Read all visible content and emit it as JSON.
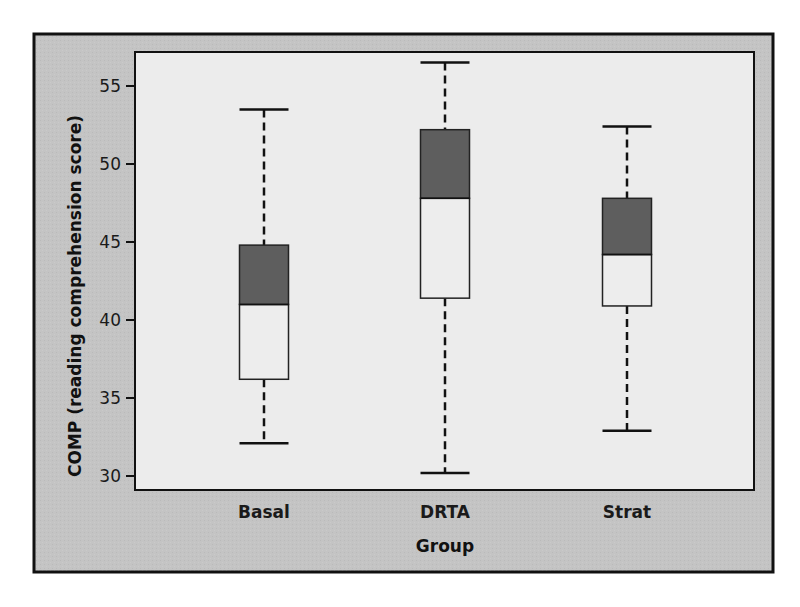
{
  "chart_data": {
    "type": "box",
    "title": "",
    "xlabel": "Group",
    "ylabel": "COMP (reading comprehension score)",
    "ylim": [
      29.3,
      57.5
    ],
    "yticks": [
      30,
      35,
      40,
      45,
      50,
      55
    ],
    "ytick_labels": [
      "30",
      "35",
      "40",
      "45",
      "50",
      "55"
    ],
    "categories": [
      "Basal",
      "DRTA",
      "Strat"
    ],
    "series": [
      {
        "name": "Basal",
        "min": 32.1,
        "q1": 36.2,
        "median": 41.0,
        "q3": 44.8,
        "max": 53.5
      },
      {
        "name": "DRTA",
        "min": 30.2,
        "q1": 41.4,
        "median": 47.8,
        "q3": 52.2,
        "max": 56.5
      },
      {
        "name": "Strat",
        "min": 32.9,
        "q1": 40.9,
        "median": 44.2,
        "q3": 47.8,
        "max": 52.4
      }
    ],
    "colors": {
      "outer_panel": "#c4c4c4",
      "plot_background": "#ececec",
      "upper_box_fill": "#5e5e5e",
      "lower_box_fill": "#ededed",
      "frame": "#111111"
    },
    "grid": false,
    "legend": "none"
  }
}
